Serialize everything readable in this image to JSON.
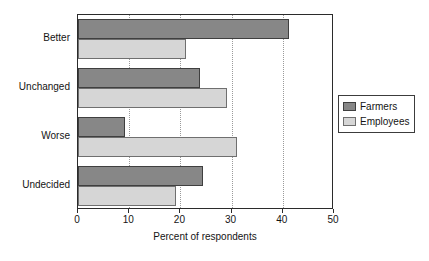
{
  "chart_data": {
    "type": "bar",
    "orientation": "horizontal",
    "title": "",
    "xlabel": "Percent of respondents",
    "ylabel": "",
    "xlim": [
      0,
      50
    ],
    "xticks": [
      0,
      10,
      20,
      30,
      40,
      50
    ],
    "xtick_labels": [
      "0",
      "10",
      "20",
      "30",
      "40",
      "50"
    ],
    "grid": "vertical-dotted",
    "legend_position": "right",
    "categories": [
      "Better",
      "Unchanged",
      "Worse",
      "Undecided"
    ],
    "series": [
      {
        "name": "Farmers",
        "color": "#878787",
        "values": [
          41.2,
          23.8,
          9.2,
          24.4
        ]
      },
      {
        "name": "Employees",
        "color": "#d6d6d6",
        "values": [
          21.1,
          29.1,
          31.1,
          19.1
        ]
      }
    ]
  },
  "axis": {
    "x_title": "Percent of respondents"
  },
  "legend": {
    "entries": [
      {
        "label": "Farmers"
      },
      {
        "label": "Employees"
      }
    ]
  }
}
